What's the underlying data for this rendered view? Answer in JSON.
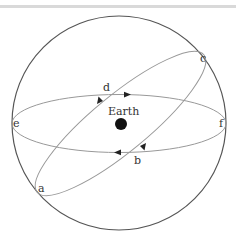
{
  "diagram": {
    "center_label": "Earth",
    "points": {
      "a": "a",
      "b": "b",
      "c": "c",
      "d": "d",
      "e": "e",
      "f": "f"
    },
    "colors": {
      "outer_circle": "#555555",
      "orbits": "#999999",
      "earth": "#111111",
      "arrows": "#222222",
      "top_bar": "#d9d9d9"
    }
  }
}
